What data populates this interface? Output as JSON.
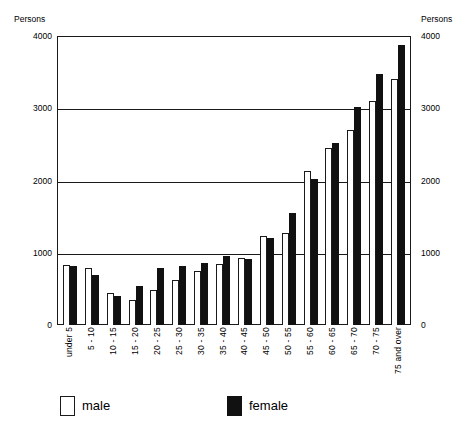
{
  "axes": {
    "left_caption": "Persons",
    "right_caption": "Persons",
    "ticks": [
      "4000",
      "3000",
      "2000",
      "1000",
      "0"
    ]
  },
  "legend": {
    "male_label": "male",
    "female_label": "female"
  },
  "chart_data": {
    "type": "bar",
    "title": "",
    "xlabel": "",
    "ylabel": "Persons",
    "ylim": [
      0,
      4000
    ],
    "yticks": [
      0,
      1000,
      2000,
      3000,
      4000
    ],
    "grid": true,
    "legend_position": "bottom",
    "categories": [
      "under 5",
      "5 - 10",
      "10 - 15",
      "15 - 20",
      "20 - 25",
      "25 - 30",
      "30 - 35",
      "35 - 40",
      "40 - 45",
      "45 - 50",
      "50 - 55",
      "55 - 60",
      "60 - 65",
      "65 - 70",
      "70 - 75",
      "75 and over"
    ],
    "series": [
      {
        "name": "male",
        "color": "#ffffff",
        "values": [
          830,
          790,
          440,
          350,
          490,
          620,
          750,
          840,
          930,
          1230,
          1270,
          2130,
          2450,
          2700,
          3100,
          3400
        ]
      },
      {
        "name": "female",
        "color": "#111111",
        "values": [
          810,
          690,
          400,
          540,
          790,
          810,
          860,
          950,
          920,
          1210,
          1550,
          2020,
          2520,
          3020,
          3470,
          3870
        ]
      }
    ]
  }
}
